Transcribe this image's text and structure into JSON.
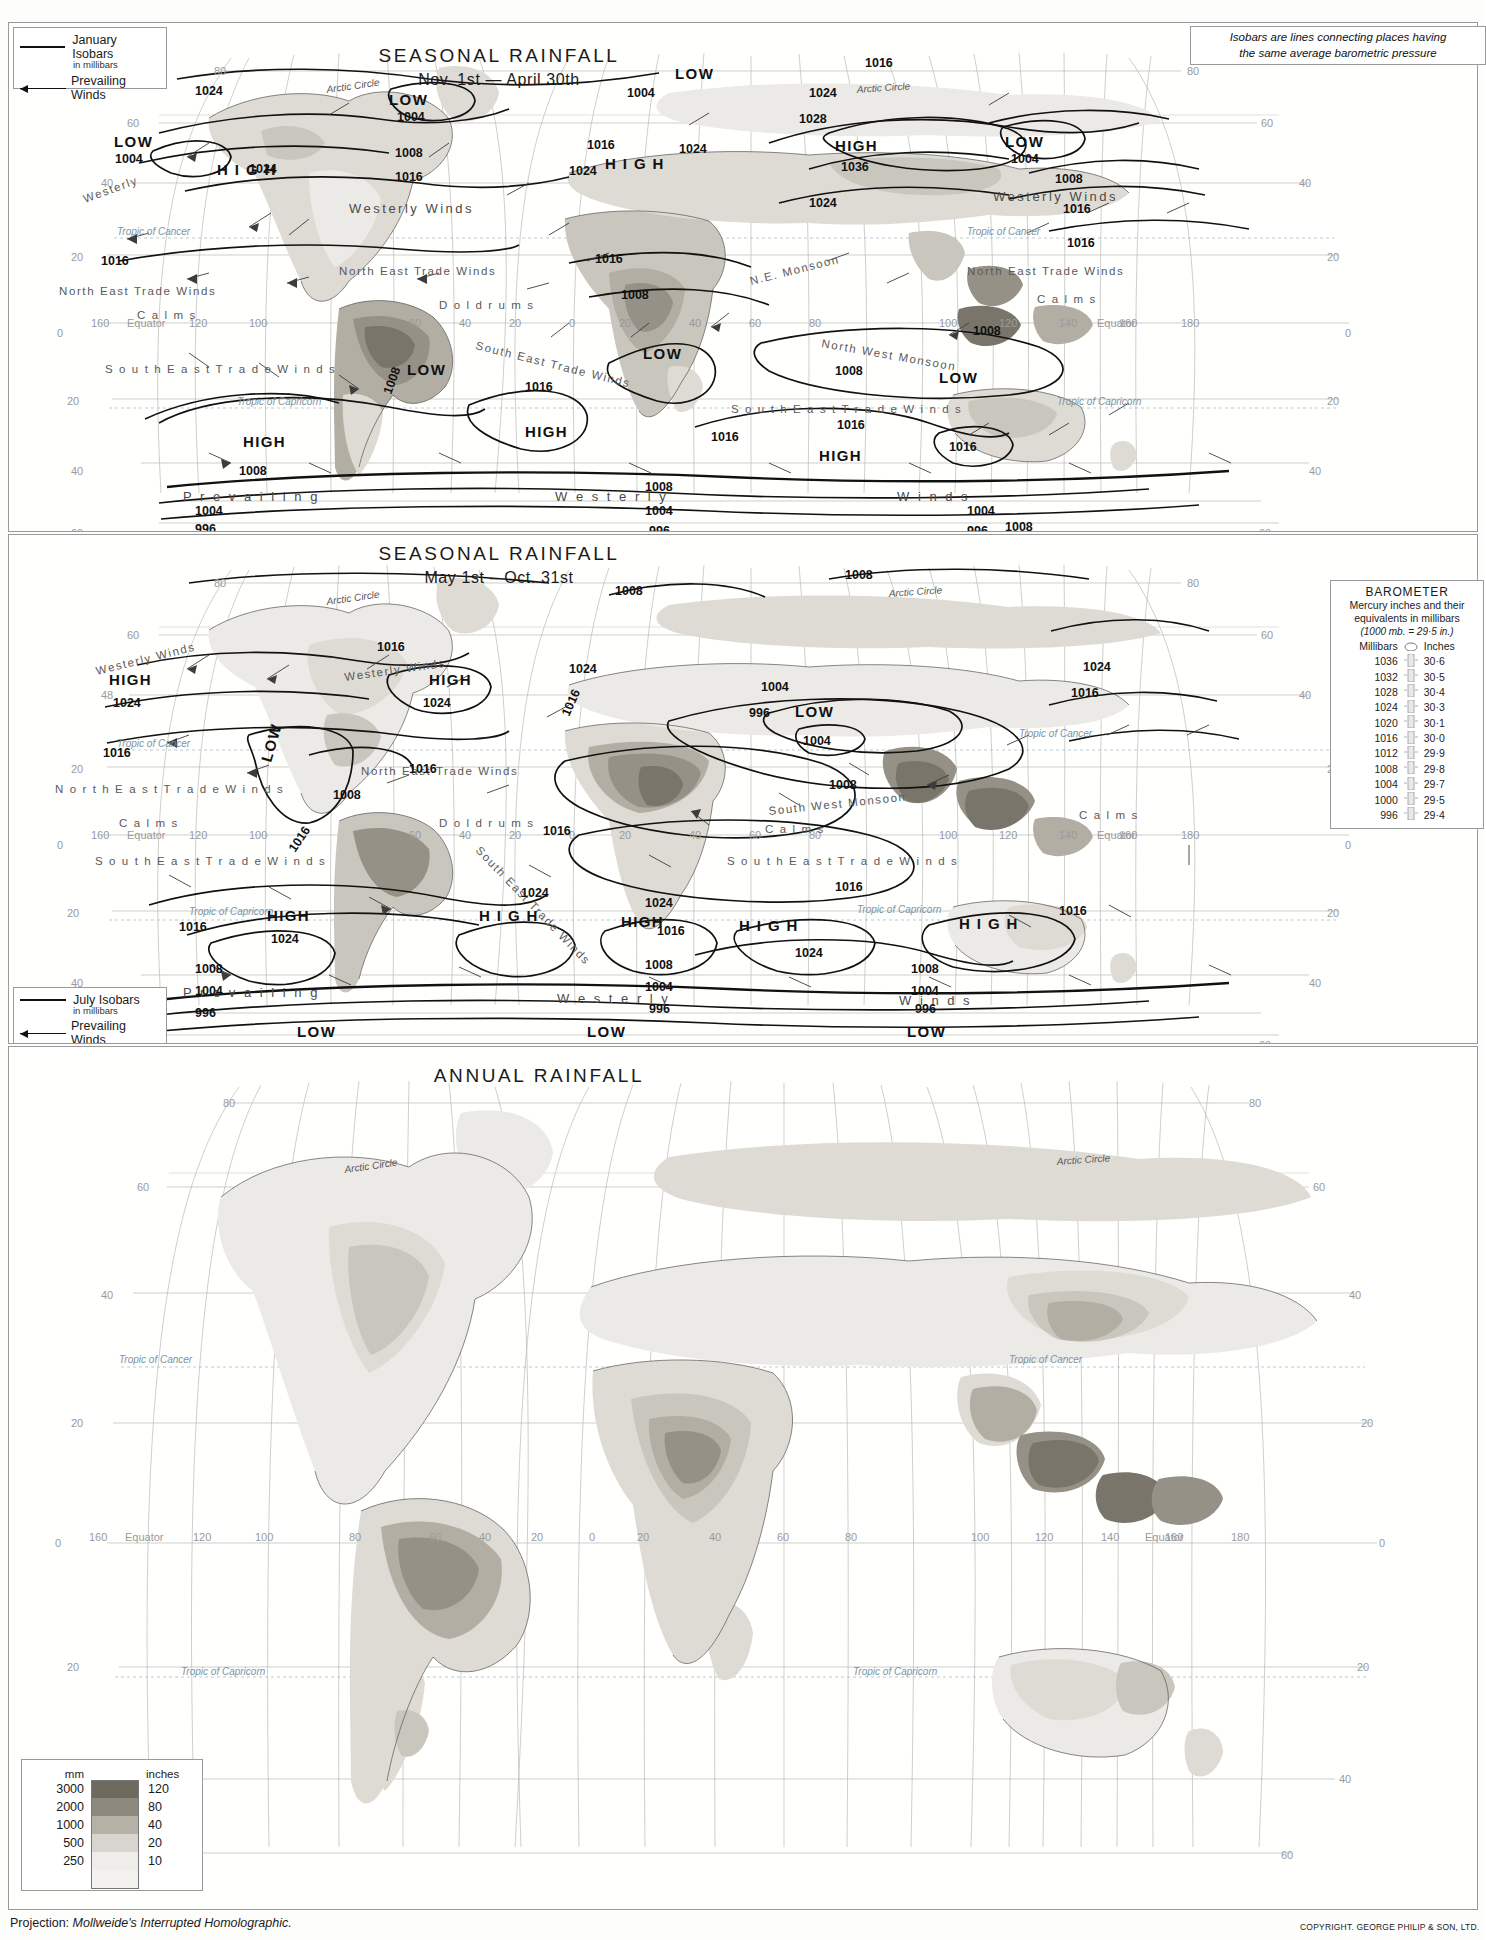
{
  "page": {
    "projection_note": "Projection: Mollweide's Interrupted Homolographic.",
    "projection_label": "Projection:",
    "projection_value": "Mollweide's Interrupted Homolographic.",
    "copyright": "COPYRIGHT. GEORGE PHILIP & SON, LTD."
  },
  "note_box": {
    "line1": "Isobars are lines connecting places having",
    "line2": "the same average barometric pressure"
  },
  "panels": [
    {
      "id": "january",
      "title": "SEASONAL RAINFALL",
      "subtitle": "Nov. 1st — April 30th",
      "legend": {
        "isobar_label": "January Isobars",
        "isobar_sub": "in millibars",
        "wind_label": "Prevailing Winds"
      }
    },
    {
      "id": "july",
      "title": "SEASONAL RAINFALL",
      "subtitle": "May 1st – Oct. 31st",
      "legend": {
        "isobar_label": "July Isobars",
        "isobar_sub": "in millibars",
        "wind_label": "Prevailing Winds"
      }
    },
    {
      "id": "annual",
      "title": "ANNUAL RAINFALL",
      "subtitle": ""
    }
  ],
  "rain_scale_seasonal": {
    "header_mm": "mm",
    "header_in": "inches",
    "rows": [
      {
        "mm": "2000",
        "inches": "80",
        "color": "#7a756b"
      },
      {
        "mm": "1500",
        "inches": "60",
        "color": "#928d82"
      },
      {
        "mm": "1000",
        "inches": "40",
        "color": "#aaa69c"
      },
      {
        "mm": "750",
        "inches": "30",
        "color": "#c4c0b7"
      },
      {
        "mm": "500",
        "inches": "20",
        "color": "#dcd9d2"
      },
      {
        "mm": "250",
        "inches": "10",
        "color": "#eeece7"
      },
      {
        "mm": "125",
        "inches": "5",
        "color": "#fbfaf8"
      }
    ]
  },
  "rain_scale_annual": {
    "header_mm": "mm",
    "header_in": "inches",
    "rows": [
      {
        "mm": "3000",
        "inches": "120",
        "color": "#6f6a60"
      },
      {
        "mm": "2000",
        "inches": "80",
        "color": "#8e897e"
      },
      {
        "mm": "1000",
        "inches": "40",
        "color": "#b5b1a7"
      },
      {
        "mm": "500",
        "inches": "20",
        "color": "#d8d5ce"
      },
      {
        "mm": "250",
        "inches": "10",
        "color": "#efede9"
      }
    ]
  },
  "barometer": {
    "title": "BAROMETER",
    "subtitle_line1": "Mercury inches and their",
    "subtitle_line2": "equivalents in millibars",
    "conversion": "(1000 mb. = 29·5 in.)",
    "col_mb": "Millibars",
    "col_in": "Inches",
    "rows": [
      {
        "mb": "1036",
        "in": "30·6"
      },
      {
        "mb": "1032",
        "in": "30·5"
      },
      {
        "mb": "1028",
        "in": "30·4"
      },
      {
        "mb": "1024",
        "in": "30·3"
      },
      {
        "mb": "1020",
        "in": "30·1"
      },
      {
        "mb": "1016",
        "in": "30·0"
      },
      {
        "mb": "1012",
        "in": "29·9"
      },
      {
        "mb": "1008",
        "in": "29·8"
      },
      {
        "mb": "1004",
        "in": "29·7"
      },
      {
        "mb": "1000",
        "in": "29·5"
      },
      {
        "mb": "996",
        "in": "29·4"
      }
    ]
  },
  "chart_data": {
    "type": "map",
    "projection": "Mollweide's Interrupted Homolographic",
    "maps": [
      {
        "name": "SEASONAL RAINFALL Nov. 1st — April 30th",
        "isobar_season": "January",
        "isobar_values_mb": [
          996,
          1004,
          1008,
          1016,
          1024,
          1028,
          1036
        ],
        "pressure_cells": [
          {
            "type": "LOW",
            "value": "1004",
            "region": "North Pacific (Aleutian)"
          },
          {
            "type": "LOW",
            "value": "1004",
            "region": "North Atlantic (Icelandic)"
          },
          {
            "type": "HIGH",
            "value": "1024",
            "region": "North America"
          },
          {
            "type": "HIGH",
            "value": "1024",
            "region": "Atlantic (Azores)"
          },
          {
            "type": "HIGH",
            "value": "1036",
            "region": "Siberia"
          },
          {
            "type": "LOW",
            "value": "1008",
            "region": "South America"
          },
          {
            "type": "LOW",
            "value": "",
            "region": "Southern Africa"
          },
          {
            "type": "LOW",
            "value": "",
            "region": "Northern Australia"
          },
          {
            "type": "HIGH",
            "value": "",
            "region": "South Pacific"
          },
          {
            "type": "HIGH",
            "value": "",
            "region": "South Atlantic"
          },
          {
            "type": "HIGH",
            "value": "1016",
            "region": "Southern Australia"
          },
          {
            "type": "LOW",
            "value": "996",
            "region": "Southern Ocean (circumpolar trough)"
          }
        ],
        "wind_belts": [
          "Westerly Winds",
          "North East Trade Winds",
          "Doldrums",
          "Calms",
          "South East Trade Winds",
          "N.E. Monsoon",
          "North West Monsoon",
          "Prevailing Westerly Winds"
        ]
      },
      {
        "name": "SEASONAL RAINFALL May 1st – Oct. 31st",
        "isobar_season": "July",
        "isobar_values_mb": [
          996,
          1004,
          1008,
          1016,
          1024
        ],
        "pressure_cells": [
          {
            "type": "HIGH",
            "value": "1024",
            "region": "North Pacific"
          },
          {
            "type": "HIGH",
            "value": "1024",
            "region": "North Atlantic (Azores)"
          },
          {
            "type": "LOW",
            "value": "1008",
            "region": "South-western North America"
          },
          {
            "type": "LOW",
            "value": "996",
            "region": "Asia (Thermal low)"
          },
          {
            "type": "HIGH",
            "value": "1024",
            "region": "South Pacific"
          },
          {
            "type": "HIGH",
            "value": "",
            "region": "South Atlantic"
          },
          {
            "type": "HIGH",
            "value": "",
            "region": "Southern Africa"
          },
          {
            "type": "HIGH",
            "value": "",
            "region": "Indian Ocean"
          },
          {
            "type": "HIGH",
            "value": "",
            "region": "Australia"
          },
          {
            "type": "LOW",
            "value": "996",
            "region": "Southern Ocean (circumpolar trough)"
          }
        ],
        "wind_belts": [
          "Westerly Winds",
          "North East Trade Winds",
          "Doldrums",
          "Calms",
          "South East Trade Winds",
          "South West Monsoon",
          "Prevailing Westerly Winds"
        ]
      },
      {
        "name": "ANNUAL RAINFALL",
        "isobar_season": "",
        "isobar_values_mb": [],
        "pressure_cells": [],
        "wind_belts": []
      }
    ],
    "graticule_labels": {
      "latitudes": [
        "80",
        "60",
        "40",
        "20",
        "0",
        "20",
        "40",
        "60",
        "80"
      ],
      "longitudes": [
        "160",
        "140",
        "120",
        "100",
        "80",
        "60",
        "40",
        "20",
        "0",
        "20",
        "40",
        "60",
        "80",
        "100",
        "120",
        "140",
        "160",
        "180"
      ],
      "special": [
        "Arctic Circle",
        "Tropic of Cancer",
        "Equator",
        "Tropic of Capricorn"
      ]
    }
  },
  "map_labels": {
    "arctic_circle": "Arctic Circle",
    "tropic_cancer": "Tropic of Cancer",
    "tropic_capricorn": "Tropic of Capricorn",
    "equator": "Equator",
    "high": "HIGH",
    "low": "LOW",
    "westerly": "Westerly Winds",
    "ne_trades": "North East Trade Winds",
    "se_trades": "South East Trade Winds",
    "doldrums": "Doldrums",
    "calms": "Calms",
    "prevailing": "Prevailing",
    "westerlies": "Westerly Winds",
    "ne_monsoon": "N.E. Monsoon",
    "nw_monsoon": "North West Monsoon",
    "sw_monsoon": "South West Monsoon"
  }
}
